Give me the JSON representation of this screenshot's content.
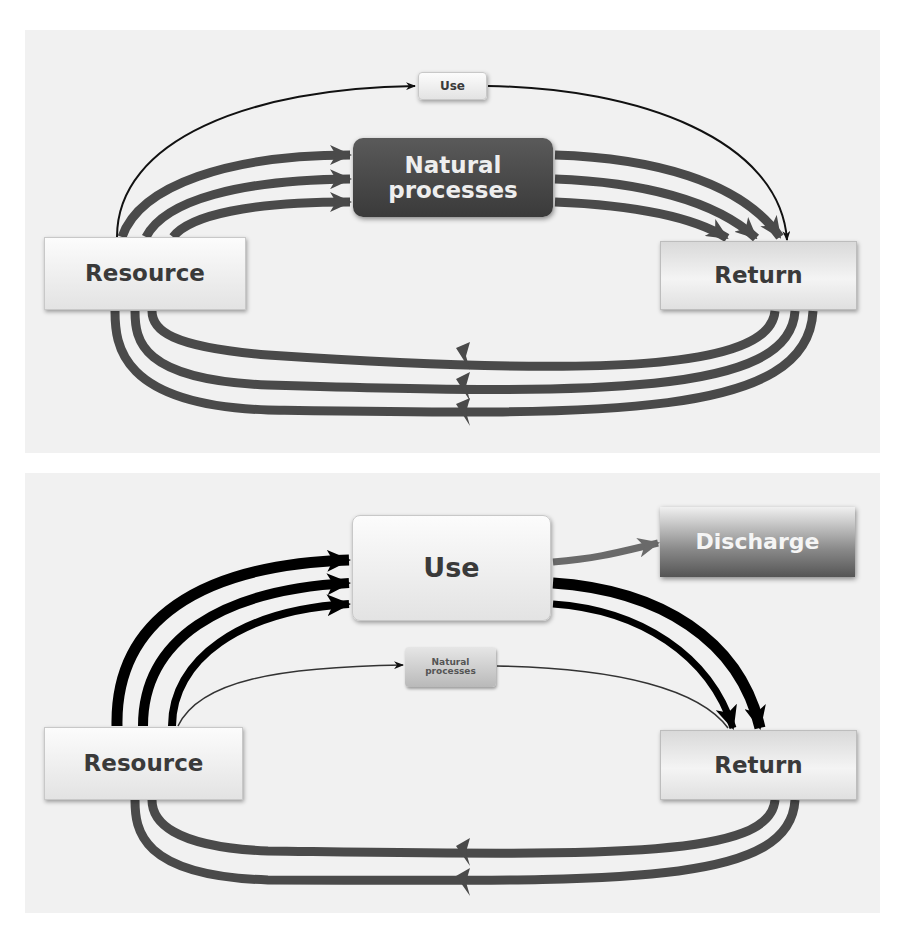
{
  "colors": {
    "panel_bg": "#f1f1f1",
    "flow_dark_gray": "#4a4a4a",
    "flow_black": "#000000",
    "thin_line": "#111111",
    "discharge_flow": "#6a6a6a"
  },
  "diagrams": [
    {
      "id": "natural-cycle",
      "nodes": {
        "resource": "Resource",
        "return": "Return",
        "use": "Use",
        "natural_processes": "Natural processes"
      },
      "flows": [
        {
          "from": "Resource",
          "to": "Use",
          "weight": "thin"
        },
        {
          "from": "Use",
          "to": "Return",
          "weight": "thin"
        },
        {
          "from": "Resource",
          "to": "Natural processes",
          "weight": "thick",
          "count": 3
        },
        {
          "from": "Natural processes",
          "to": "Return",
          "weight": "thick",
          "count": 3
        },
        {
          "from": "Return",
          "to": "Resource",
          "weight": "thick",
          "count": 3
        }
      ]
    },
    {
      "id": "human-use-cycle",
      "nodes": {
        "resource": "Resource",
        "return": "Return",
        "use": "Use",
        "natural_processes": "Natural processes",
        "discharge": "Discharge"
      },
      "flows": [
        {
          "from": "Resource",
          "to": "Use",
          "weight": "thick",
          "count": 3
        },
        {
          "from": "Use",
          "to": "Discharge",
          "weight": "medium",
          "count": 1
        },
        {
          "from": "Use",
          "to": "Return",
          "weight": "thick",
          "count": 2
        },
        {
          "from": "Resource",
          "to": "Natural processes",
          "weight": "thin"
        },
        {
          "from": "Natural processes",
          "to": "Return",
          "weight": "thin"
        },
        {
          "from": "Return",
          "to": "Resource",
          "weight": "thick",
          "count": 2
        }
      ]
    }
  ]
}
